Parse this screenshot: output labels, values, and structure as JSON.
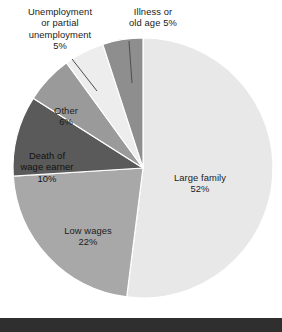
{
  "chart_data": {
    "type": "pie",
    "title": "",
    "subtitle": "",
    "xlabel": "",
    "ylabel": "",
    "legend_position": "none",
    "grid": false,
    "unit": "%",
    "start_angle_deg": 0,
    "direction": "clockwise",
    "categories": [
      "Large family",
      "Low wages",
      "Death of wage earner",
      "Other",
      "Unemployment or partial unemployment",
      "Illness or old age"
    ],
    "values": [
      52,
      22,
      10,
      6,
      5,
      5
    ],
    "colors": [
      "#e8e8e8",
      "#a8a8a8",
      "#5a5a5a",
      "#9a9a9a",
      "#ededed",
      "#8e8e8e"
    ],
    "slices": [
      {
        "name": "Large family",
        "value": 52,
        "label_line1": "Large family",
        "label_pct": "52%",
        "color": "#e8e8e8",
        "label_placement": "inside"
      },
      {
        "name": "Low wages",
        "value": 22,
        "label_line1": "Low wages",
        "label_pct": "22%",
        "color": "#a8a8a8",
        "label_placement": "inside"
      },
      {
        "name": "Death of wage earner",
        "value": 10,
        "label_line1": "Death of",
        "label_line2": "wage earner",
        "label_pct": "10%",
        "color": "#5a5a5a",
        "label_placement": "inside"
      },
      {
        "name": "Other",
        "value": 6,
        "label_line1": "Other",
        "label_pct": "6%",
        "color": "#9a9a9a",
        "label_placement": "inside"
      },
      {
        "name": "Unemployment or partial unemployment",
        "value": 5,
        "label_line1": "Unemployment",
        "label_line2": "or partial",
        "label_line3": "unemployment",
        "label_pct": "5%",
        "color": "#ededed",
        "label_placement": "outside-leader"
      },
      {
        "name": "Illness or old age",
        "value": 5,
        "label_line1": "Illness or",
        "label_line2": "old age 5%",
        "label_pct": "5%",
        "color": "#8e8e8e",
        "label_placement": "outside-leader"
      }
    ]
  },
  "labels": {
    "unemployment": "Unemployment\nor partial\nunemployment\n5%",
    "illness": "Illness or\nold age 5%",
    "other": "Other\n6%",
    "death_of_wage_earner": "Death of\nwage earner\n10%",
    "low_wages": "Low wages\n22%",
    "large_family": "Large family\n52%"
  },
  "style": {
    "background": "#ffffff",
    "text_color": "#1a1a1a",
    "leader_line_color": "#4d4d4d",
    "footer_band_color": "#2f2f2f",
    "pie_center_x": 143,
    "pie_center_y": 168,
    "pie_radius": 130
  }
}
